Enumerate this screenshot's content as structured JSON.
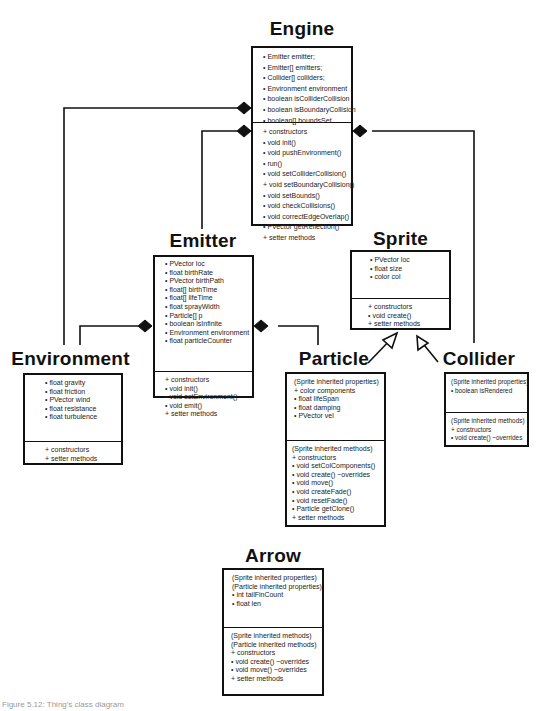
{
  "diagram": {
    "type": "UML class diagram",
    "classes": {
      "engine": {
        "name": "Engine",
        "properties": [
          "• Emitter emitter;",
          "• Emitter[] emitters;",
          "• Collider[] colliders;",
          "• Environment environment",
          "• boolean isColliderCollision",
          "• boolean isBoundaryCollision",
          "• boolean[] boundsSet"
        ],
        "methods": [
          "+ constructors",
          "• void init()",
          "• void pushEnvironment()",
          "• run()",
          "• void setColliderCollision()",
          "+ void setBoundaryCollision()",
          "• void setBounds()",
          "• void checkCollisions()",
          "• void correctEdgeOverlap()",
          "• PVector getReflection()",
          "+ setter methods"
        ]
      },
      "emitter": {
        "name": "Emitter",
        "properties": [
          "• PVector loc",
          "• float birthRate",
          "• PVector birthPath",
          "• float[] birthTime",
          "• float[] lifeTime",
          "• float sprayWidth",
          "• Particle[] p",
          "• boolean isInfinite",
          "• Environment environment",
          "• float particleCounter"
        ],
        "methods": [
          "+ constructors",
          "• void init()",
          "• void setEnvironment()",
          "• void emit()",
          "+ setter methods"
        ]
      },
      "environment": {
        "name": "Environment",
        "properties": [
          "• float gravity",
          "• float friction",
          "• PVector wind",
          "• float resistance",
          "• float turbulence"
        ],
        "methods": [
          "+ constructors",
          "+ setter methods"
        ]
      },
      "sprite": {
        "name": "Sprite",
        "properties": [
          "• PVector loc",
          "• float size",
          "• color col"
        ],
        "methods": [
          "+ constructors",
          "• void create()",
          "+ setter methods"
        ]
      },
      "particle": {
        "name": "Particle",
        "properties": [
          "(Sprite inherited properties)",
          "+ color components",
          "• float lifeSpan",
          "• float damping",
          "• PVector vel"
        ],
        "methods": [
          "(Sprite inherited methods)",
          "+ constructors",
          "• void setColComponents()",
          "• void create() ~overrides",
          "• void move()",
          "• void createFade()",
          "• void resetFade()",
          "• Particle getClone()",
          "+ setter methods"
        ]
      },
      "collider": {
        "name": "Collider",
        "properties": [
          "(Sprite inherited properties)",
          "• boolean isRendered"
        ],
        "methods": [
          "(Sprite inherited methods)",
          "+ constructors",
          "• void create() ~overrides"
        ]
      },
      "arrow": {
        "name": "Arrow",
        "properties": [
          "(Sprite inherited properties)",
          "(Particle inherited properties)",
          "• int tailFinCount",
          "• float len"
        ],
        "methods": [
          "(Sprite inherited methods)",
          "(Particle inherited methods)",
          "+ constructors",
          "• void create() ~overrides",
          "• void move() ~overrides",
          "+ setter methods"
        ]
      }
    },
    "relationships": [
      {
        "type": "composition",
        "whole": "Engine",
        "part": "Environment"
      },
      {
        "type": "composition",
        "whole": "Engine",
        "part": "Emitter"
      },
      {
        "type": "composition",
        "whole": "Engine",
        "part": "Collider"
      },
      {
        "type": "composition",
        "whole": "Emitter",
        "part": "Environment"
      },
      {
        "type": "composition",
        "whole": "Emitter",
        "part": "Particle"
      },
      {
        "type": "inheritance",
        "child": "Particle",
        "parent": "Sprite"
      },
      {
        "type": "inheritance",
        "child": "Collider",
        "parent": "Sprite"
      },
      {
        "type": "inheritance",
        "child": "Arrow",
        "parent": "Particle"
      }
    ],
    "caption": "Figure 5.12: Thing's class diagram"
  }
}
